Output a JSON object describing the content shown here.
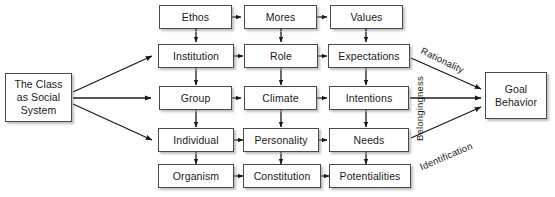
{
  "diagram": {
    "background_color": "#ffffff",
    "box_border_color": "#4a4a4a",
    "text_color": "#1a1a1a",
    "source_node": {
      "label": "The Class\nas Social\nSystem",
      "line1": "The Class",
      "line2": "as Social",
      "line3": "System"
    },
    "target_node": {
      "label": "Goal Behavior",
      "line1": "Goal",
      "line2": "Behavior"
    },
    "grid_rows": [
      {
        "row": 1,
        "cells": [
          "Ethos",
          "Mores",
          "Values"
        ]
      },
      {
        "row": 2,
        "cells": [
          "Institution",
          "Role",
          "Expectations"
        ]
      },
      {
        "row": 3,
        "cells": [
          "Group",
          "Climate",
          "Intentions"
        ]
      },
      {
        "row": 4,
        "cells": [
          "Individual",
          "Personality",
          "Needs"
        ]
      },
      {
        "row": 5,
        "cells": [
          "Organism",
          "Constitution",
          "Potentialities"
        ]
      }
    ],
    "nodes": {
      "ethos": "Ethos",
      "mores": "Mores",
      "values": "Values",
      "institution": "Institution",
      "role": "Role",
      "expectations": "Expectations",
      "group": "Group",
      "climate": "Climate",
      "intentions": "Intentions",
      "individual": "Individual",
      "personality": "Personality",
      "needs": "Needs",
      "organism": "Organism",
      "constitution": "Constitution",
      "potentialities": "Potentialities"
    },
    "edge_labels": {
      "rationality": "Rationality",
      "belongingness": "Belongingness",
      "identification": "Identification"
    }
  }
}
